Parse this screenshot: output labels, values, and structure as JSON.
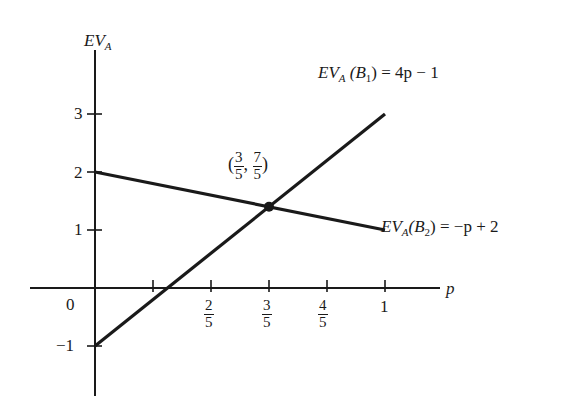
{
  "chart_data": {
    "type": "line",
    "title": "",
    "xlabel": "p",
    "ylabel": "EV_A",
    "xlim": [
      -0.22,
      1.2
    ],
    "ylim": [
      -1.85,
      4.05
    ],
    "grid": false,
    "x_ticks": [
      {
        "value": 0.2,
        "label": ""
      },
      {
        "value": 0.4,
        "label_num": "2",
        "label_den": "5"
      },
      {
        "value": 0.6,
        "label_num": "3",
        "label_den": "5"
      },
      {
        "value": 0.8,
        "label_num": "4",
        "label_den": "5"
      },
      {
        "value": 1.0,
        "label": "1"
      }
    ],
    "y_ticks": [
      {
        "value": 3,
        "label": "3"
      },
      {
        "value": 2,
        "label": "2"
      },
      {
        "value": 1,
        "label": "1"
      },
      {
        "value": -1,
        "label": "−1"
      }
    ],
    "origin_label": "0",
    "series": [
      {
        "name": "EV_A(B1) = 4p − 1",
        "label_parts": {
          "ev": "EV",
          "sub": "A",
          "paren": "(B",
          "paren_sub": "1",
          "eq": ") = 4p − 1"
        },
        "x": [
          0,
          1
        ],
        "y": [
          -1,
          3
        ],
        "color": "#1a1a1a"
      },
      {
        "name": "EV_A(B2) = −p + 2",
        "label_parts": {
          "ev": "EV",
          "sub": "A",
          "paren": "(B",
          "paren_sub": "2",
          "eq": ") = −p + 2"
        },
        "x": [
          0,
          1
        ],
        "y": [
          2,
          1
        ],
        "color": "#1a1a1a"
      }
    ],
    "annotations": [
      {
        "type": "point",
        "x": 0.6,
        "y": 1.4,
        "label": "(3/5, 7/5)",
        "label_parts": {
          "x_num": "3",
          "x_den": "5",
          "y_num": "7",
          "y_den": "5"
        }
      }
    ]
  },
  "axes": {
    "y_title": {
      "main": "EV",
      "sub": "A"
    },
    "x_title": "p"
  }
}
